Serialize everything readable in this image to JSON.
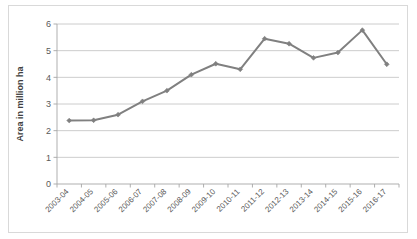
{
  "chart_data": {
    "type": "line",
    "title": "",
    "xlabel": "",
    "ylabel": "Area in million ha",
    "ylim": [
      0,
      6
    ],
    "ytick_labels": [
      "0",
      "1",
      "2",
      "3",
      "4",
      "5",
      "6"
    ],
    "ytick_values": [
      0,
      1,
      2,
      3,
      4,
      5,
      6
    ],
    "grid": true,
    "legend": "none",
    "series_color": "#808080",
    "marker": "diamond",
    "categories": [
      "2003-04",
      "2004-05",
      "2005-06",
      "2006-07",
      "2007-08",
      "2008-09",
      "2009-10",
      "2010-11",
      "2011-12",
      "2012-13",
      "2013-14",
      "2014-15",
      "2015-16",
      "2016-17"
    ],
    "values": [
      2.38,
      2.39,
      2.6,
      3.1,
      3.5,
      4.1,
      4.51,
      4.3,
      5.45,
      5.26,
      4.73,
      4.93,
      5.77,
      4.49
    ]
  }
}
